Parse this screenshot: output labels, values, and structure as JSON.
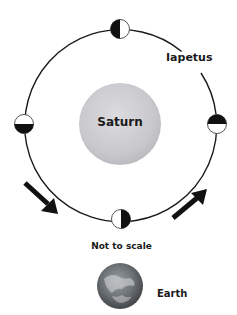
{
  "diagram": {
    "central_body": {
      "label": "Saturn",
      "color": "#c8c8cc"
    },
    "orbiting_body": {
      "label": "Iapetus"
    },
    "note": "Not to scale",
    "observer": {
      "label": "Earth"
    },
    "moon_phases": [
      {
        "position": "top",
        "dark_side": "left"
      },
      {
        "position": "right",
        "dark_side": "top"
      },
      {
        "position": "bottom",
        "dark_side": "right"
      },
      {
        "position": "left",
        "dark_side": "bottom"
      }
    ],
    "arrows": [
      {
        "position": "lower-left",
        "direction": "down-right"
      },
      {
        "position": "lower-right",
        "direction": "up-right"
      }
    ]
  }
}
